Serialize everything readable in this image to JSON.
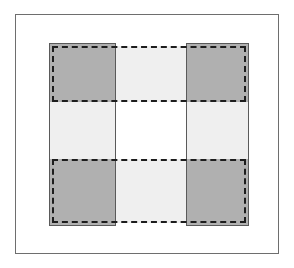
{
  "figure": {
    "width": 294,
    "height": 268,
    "background_color": "#ffffff"
  },
  "frame": {
    "label": "outer-frame",
    "x": 15,
    "y": 14,
    "width": 264,
    "height": 240,
    "stroke_color": "#6e6e6e",
    "stroke_width": 1,
    "fill_color": "#ffffff"
  },
  "palette": {
    "overlap_fill": "#b0b0b0",
    "single_fill": "#efefef",
    "empty_fill": "#ffffff",
    "solid_stroke": "#5a5a5a",
    "dashed_stroke": "#1d1d1d",
    "frame_stroke": "#6e6e6e"
  },
  "shapes": {
    "solid_set": {
      "label": "vertical-bands",
      "stroke_style": "solid",
      "stroke_color": "#5a5a5a",
      "stroke_width": 1,
      "bands": [
        {
          "label": "left-vertical-band",
          "x": 48,
          "y": 42,
          "width": 67,
          "height": 183
        },
        {
          "label": "right-vertical-band",
          "x": 185,
          "y": 42,
          "width": 63,
          "height": 183
        }
      ]
    },
    "dashed_set": {
      "label": "horizontal-bands",
      "stroke_style": "dashed",
      "stroke_color": "#1d1d1d",
      "stroke_width": 2,
      "bands": [
        {
          "label": "top-horizontal-band",
          "x": 51,
          "y": 45,
          "width": 194,
          "height": 56
        },
        {
          "label": "bottom-horizontal-band",
          "x": 51,
          "y": 158,
          "width": 194,
          "height": 64
        }
      ]
    }
  },
  "regions": [
    {
      "label": "overlap-top-left",
      "kind": "overlap",
      "x": 48,
      "y": 42,
      "width": 67,
      "height": 59,
      "fill": "#b0b0b0"
    },
    {
      "label": "overlap-top-right",
      "kind": "overlap",
      "x": 185,
      "y": 42,
      "width": 63,
      "height": 59,
      "fill": "#b0b0b0"
    },
    {
      "label": "overlap-bottom-left",
      "kind": "overlap",
      "x": 48,
      "y": 158,
      "width": 67,
      "height": 67,
      "fill": "#b0b0b0"
    },
    {
      "label": "overlap-bottom-right",
      "kind": "overlap",
      "x": 185,
      "y": 158,
      "width": 63,
      "height": 67,
      "fill": "#b0b0b0"
    },
    {
      "label": "dashed-only-top-middle",
      "kind": "dashed-only",
      "x": 115,
      "y": 45,
      "width": 70,
      "height": 56,
      "fill": "#efefef"
    },
    {
      "label": "dashed-only-bottom-middle",
      "kind": "dashed-only",
      "x": 115,
      "y": 158,
      "width": 70,
      "height": 64,
      "fill": "#efefef"
    },
    {
      "label": "solid-only-left-middle",
      "kind": "solid-only",
      "x": 48,
      "y": 101,
      "width": 67,
      "height": 57,
      "fill": "#efefef"
    },
    {
      "label": "solid-only-right-middle",
      "kind": "solid-only",
      "x": 185,
      "y": 101,
      "width": 63,
      "height": 57,
      "fill": "#efefef"
    },
    {
      "label": "empty-center",
      "kind": "neither",
      "x": 115,
      "y": 101,
      "width": 70,
      "height": 57,
      "fill": "#ffffff"
    }
  ]
}
